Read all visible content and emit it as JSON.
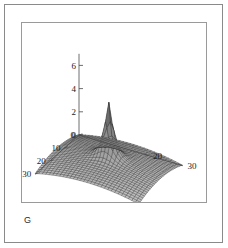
{
  "figure": {
    "label": "G",
    "has_outer_border": true,
    "has_plot_frame": true,
    "background_color": "#ffffff",
    "line_color": "#1a1a1a"
  },
  "chart_data": {
    "type": "line",
    "render_style": "3d-mesh-surface",
    "title": "",
    "subtitle": "",
    "xlabel": "",
    "ylabel": "",
    "zlabel": "",
    "grid": true,
    "legend": null,
    "legend_position": "none",
    "projection": "3d-wireframe-surface",
    "colormap": "grayscale",
    "surface_color": "#5a5a5a",
    "mesh_color": "#262626",
    "axes": {
      "x": {
        "label": "",
        "ticks": [
          0,
          10,
          20,
          30
        ],
        "tick_labels": [
          "0",
          "10",
          "20",
          "30"
        ],
        "range": [
          0,
          30
        ],
        "direction": "front-left-descending"
      },
      "y": {
        "label": "",
        "ticks": [
          0,
          10,
          20,
          30
        ],
        "tick_labels": [
          "0",
          "10",
          "20",
          "30"
        ],
        "range": [
          0,
          30
        ],
        "direction": "front-right-descending",
        "visible_tick_labels": [
          "20",
          "30"
        ]
      },
      "z": {
        "label": "",
        "ticks": [
          0,
          2,
          4,
          6
        ],
        "tick_labels": [
          "0",
          "2",
          "4",
          "6"
        ],
        "range": [
          0,
          7
        ],
        "direction": "vertical"
      }
    },
    "peak": {
      "height": 4.7,
      "x": 15,
      "y": 15,
      "shape": "sharp-spike"
    },
    "baseline_corner_heights": {
      "front": 0.0,
      "left": 0.55,
      "right": 0.55,
      "back": 1.1
    },
    "mesh_divisions": 30,
    "zlim": [
      0,
      7
    ],
    "xlim": [
      0,
      30
    ],
    "ylim": [
      0,
      30
    ]
  }
}
